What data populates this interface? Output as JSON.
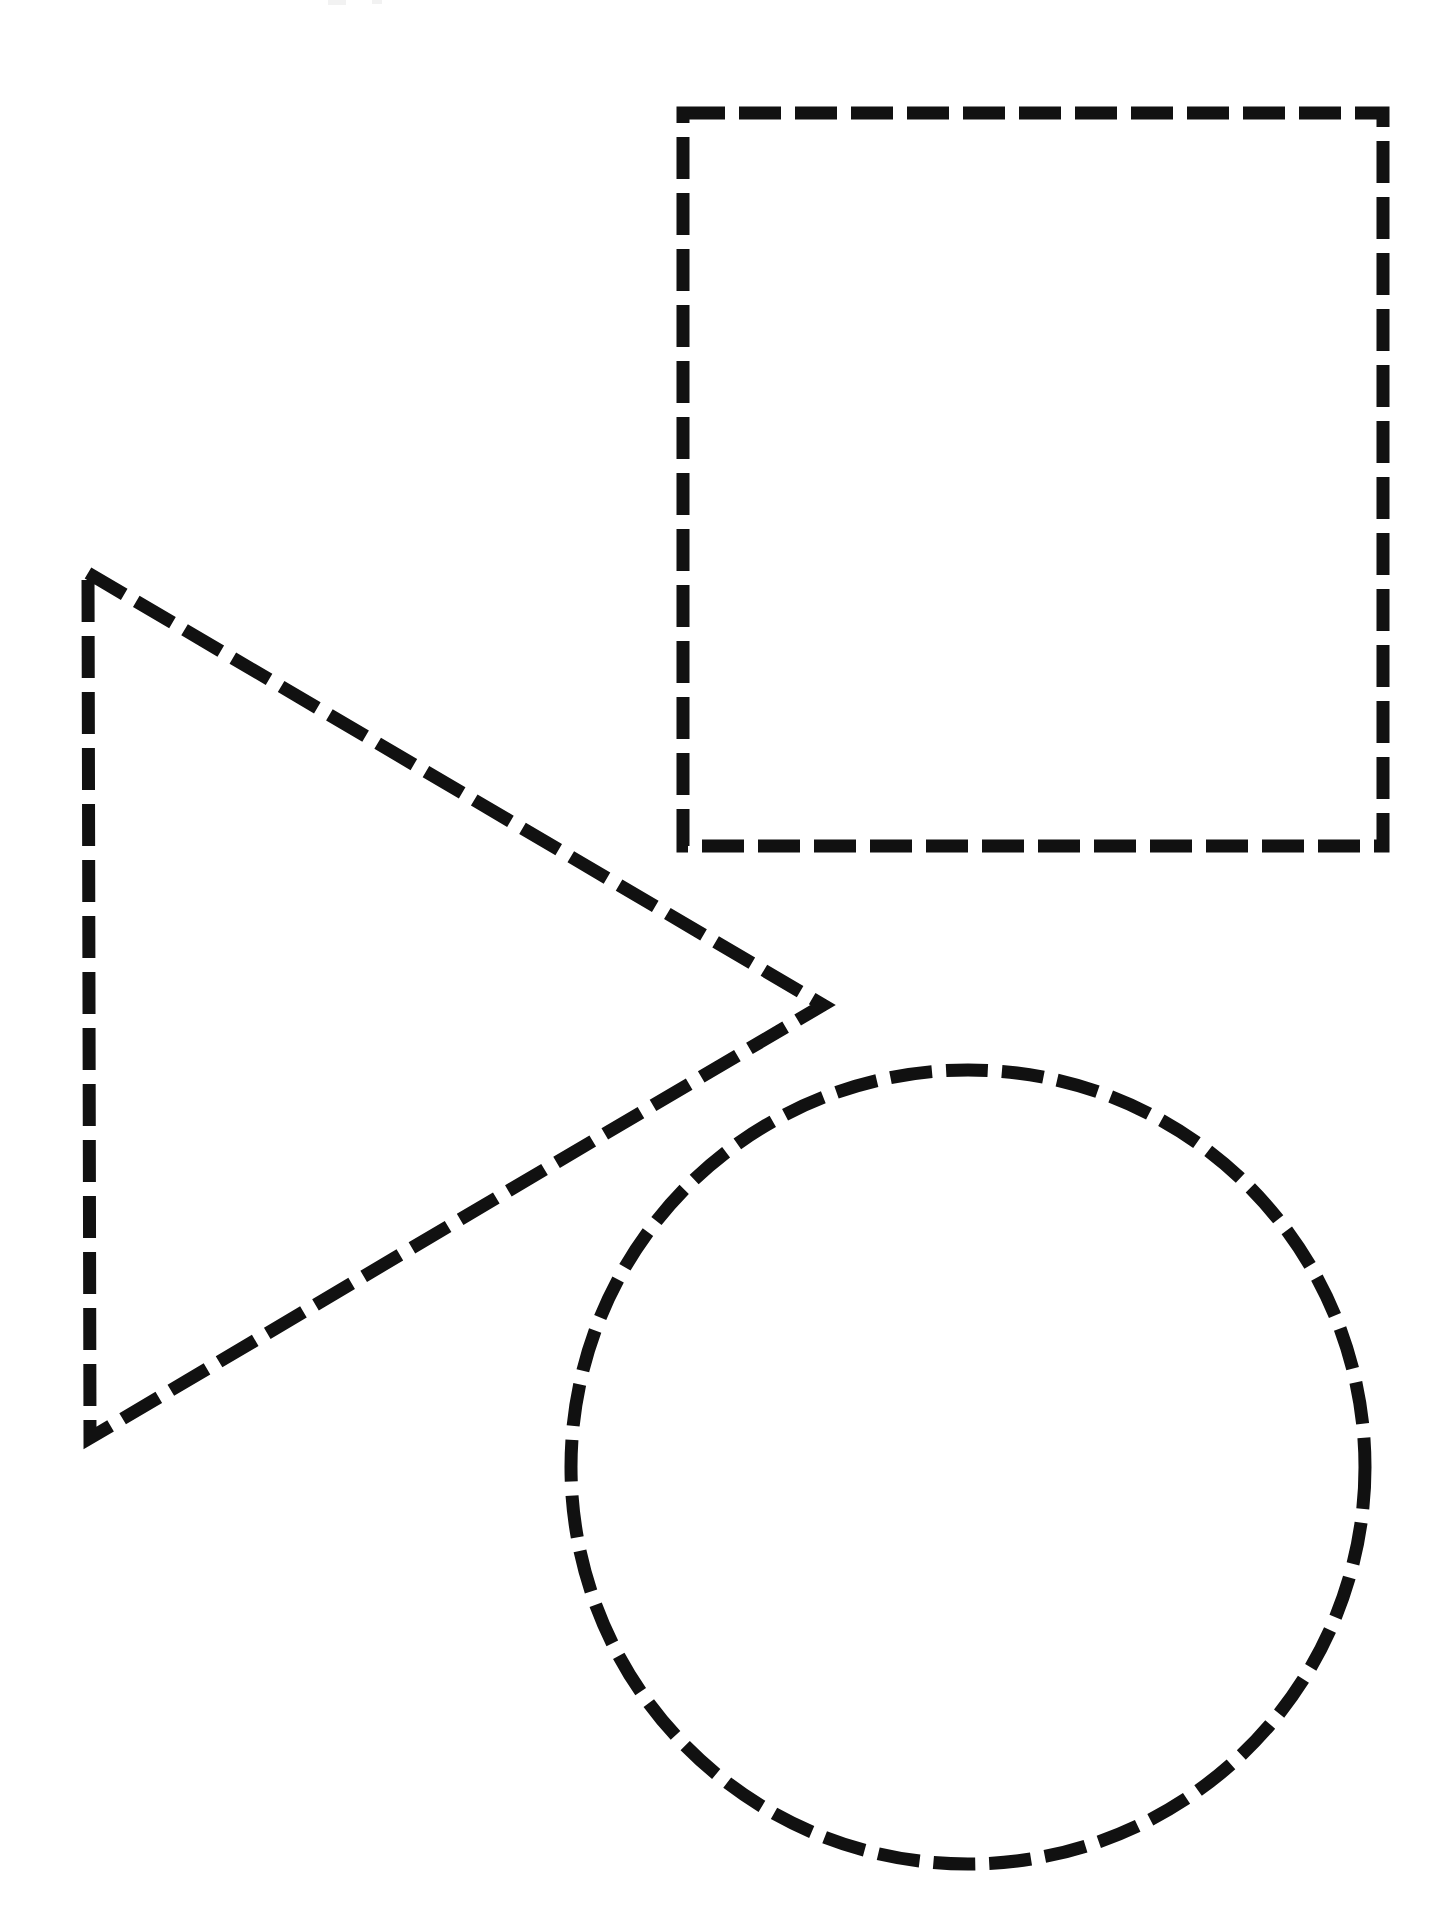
{
  "page": {
    "width": 1450,
    "height": 1928,
    "background_color": "#ffffff",
    "ink_color": "#111111"
  },
  "stroke": {
    "color": "#111111",
    "width": 13,
    "dash_length": 42,
    "dash_gap": 14,
    "linecap": "butt",
    "style": "dashed"
  },
  "shapes": [
    {
      "id": "square",
      "name": "Square",
      "type": "rectangle",
      "label": "square",
      "x": 683,
      "y": 113,
      "width": 700,
      "height": 733,
      "corners": [
        {
          "x": 683,
          "y": 113
        },
        {
          "x": 1383,
          "y": 113
        },
        {
          "x": 1383,
          "y": 846
        },
        {
          "x": 683,
          "y": 846
        }
      ]
    },
    {
      "id": "triangle",
      "name": "Triangle",
      "type": "polygon",
      "label": "triangle",
      "orientation": "pointing-right",
      "points": [
        {
          "x": 88,
          "y": 573
        },
        {
          "x": 823,
          "y": 1005
        },
        {
          "x": 90,
          "y": 1438
        }
      ],
      "points_string": "88,573 823,1005 90,1438"
    },
    {
      "id": "circle",
      "name": "Circle",
      "type": "circle",
      "label": "circle",
      "cx": 968,
      "cy": 1467,
      "r": 397
    }
  ],
  "artifacts": {
    "note": "faint scanner smudges along top edge",
    "marks": [
      {
        "id": "artifact-a",
        "x": 328,
        "y": 0,
        "width": 18,
        "height": 5
      },
      {
        "id": "artifact-b",
        "x": 372,
        "y": 0,
        "width": 10,
        "height": 4
      }
    ]
  }
}
